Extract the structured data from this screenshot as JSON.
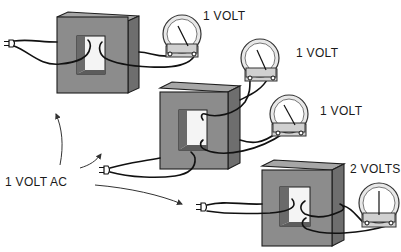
{
  "diagram": {
    "source_label": "1 VOLT AC",
    "transformers": [
      {
        "id": "transformer-1",
        "meters": [
          {
            "label": "1 VOLT",
            "reading": "1 VOLT"
          }
        ]
      },
      {
        "id": "transformer-2",
        "meters": [
          {
            "label": "1 VOLT",
            "reading": "1 VOLT"
          },
          {
            "label": "1 VOLT",
            "reading": "1 VOLT"
          }
        ]
      },
      {
        "id": "transformer-3",
        "meters": [
          {
            "label": "2 VOLTS",
            "reading": "2 VOLTS"
          }
        ]
      }
    ],
    "colors": {
      "core_front": "#8c8c8c",
      "core_top": "#a6a6a6",
      "core_side": "#6e6e6e",
      "wire": "#111111",
      "background": "#ffffff"
    }
  }
}
